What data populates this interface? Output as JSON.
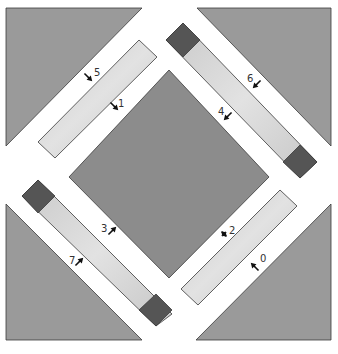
{
  "diagram": {
    "colors": {
      "background": "#ffffff",
      "corner_triangle": "#9a9a9a",
      "center_diamond": "#8c8c8c",
      "light_strip": "#d6d6d6",
      "dark_square": "#555555",
      "outline": "#3a3a3a",
      "arrow": "#111111"
    },
    "corner_triangles": [
      {
        "name": "top-left",
        "points": "6,8 142,8 6,146"
      },
      {
        "name": "top-right",
        "points": "197,8 331,8 331,146"
      },
      {
        "name": "bottom-left",
        "points": "6,204 142,340 6,340"
      },
      {
        "name": "bottom-right",
        "points": "331,204 331,340 196,340"
      }
    ],
    "center_diamond": {
      "points": "169,70 269,177 169,278 69,177"
    },
    "strips": [
      {
        "name": "top-left-strip",
        "points": "139,40 157,57 55,158 38,142",
        "has_dark_ends": false
      },
      {
        "name": "top-right-strip",
        "points": "183,23 317,162 300,178 166,40",
        "has_dark_ends": true,
        "dark_ends": [
          "183,23 200,40 183,57 166,40",
          "300,145 317,162 300,178 283,162"
        ]
      },
      {
        "name": "bottom-left-strip",
        "points": "38,180 172,314 156,326 22,196",
        "has_dark_ends": true,
        "dark_ends": [
          "38,180 55,196 38,213 22,196",
          "156,294 172,310 156,326 139,310"
        ]
      },
      {
        "name": "bottom-right-strip",
        "points": "280,190 297,206 198,305 181,289",
        "has_dark_ends": false
      }
    ],
    "markers": [
      {
        "label": "5",
        "x": 88,
        "y": 77,
        "tx": 94,
        "ty": 76,
        "dir": "down-right"
      },
      {
        "label": "1",
        "x": 114,
        "y": 106,
        "tx": 118,
        "ty": 107,
        "dir": "down-right"
      },
      {
        "label": "6",
        "x": 257,
        "y": 84,
        "tx": 247,
        "ty": 82,
        "dir": "down-left"
      },
      {
        "label": "4",
        "x": 228,
        "y": 116,
        "tx": 218,
        "ty": 115,
        "dir": "down-left"
      },
      {
        "label": "3",
        "x": 112,
        "y": 231,
        "tx": 101,
        "ty": 232,
        "dir": "up-right"
      },
      {
        "label": "7",
        "x": 79,
        "y": 262,
        "tx": 69,
        "ty": 264,
        "dir": "up-right"
      },
      {
        "label": "2",
        "x": 224,
        "y": 234,
        "tx": 229,
        "ty": 234,
        "dir": "both"
      },
      {
        "label": "0",
        "x": 255,
        "y": 267,
        "tx": 260,
        "ty": 262,
        "dir": "up-left"
      }
    ]
  }
}
